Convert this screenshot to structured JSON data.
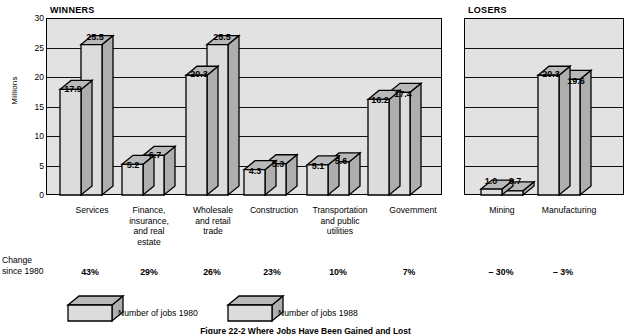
{
  "chart_data": {
    "type": "bar",
    "title": "",
    "ylabel": "Millions",
    "xlabel": "",
    "ylim": [
      0,
      30
    ],
    "yticks": [
      0,
      5,
      10,
      15,
      20,
      25,
      30
    ],
    "grid": true,
    "legend_position": "bottom",
    "panels": [
      {
        "name": "WINNERS",
        "categories": [
          "Services",
          "Finance,\ninsurance,\nand real\nestate",
          "Wholesale\nand retail\ntrade",
          "Construction",
          "Transportation\nand public\nutilities",
          "Government"
        ],
        "series": [
          {
            "name": "Number of jobs 1980",
            "values": [
              17.9,
              5.2,
              20.3,
              4.3,
              5.1,
              16.2
            ]
          },
          {
            "name": "Number of jobs 1988",
            "values": [
              25.5,
              6.7,
              25.5,
              5.3,
              5.6,
              17.4
            ]
          }
        ],
        "change_since_1980": [
          "43%",
          "29%",
          "26%",
          "23%",
          "10%",
          "7%"
        ]
      },
      {
        "name": "LOSERS",
        "categories": [
          "Mining",
          "Manufacturing"
        ],
        "series": [
          {
            "name": "Number of jobs 1980",
            "values": [
              1.0,
              20.3
            ]
          },
          {
            "name": "Number of jobs 1988",
            "values": [
              0.7,
              19.6
            ]
          }
        ],
        "change_since_1980": [
          "– 30%",
          "– 3%"
        ]
      }
    ]
  },
  "panel_titles": {
    "winners": "WINNERS",
    "losers": "LOSERS"
  },
  "axis": {
    "ylabel": "Millions",
    "ticks": [
      "30",
      "25",
      "20",
      "15",
      "10",
      "5",
      "0"
    ]
  },
  "change_row": {
    "line1": "Change",
    "line2": "since 1980"
  },
  "legend": {
    "items": [
      {
        "label": "Number of jobs 1980"
      },
      {
        "label": "Number of jobs 1988"
      }
    ]
  },
  "caption": {
    "text": "Figure 22-2   Where Jobs Have Been Gained and Lost"
  },
  "values": {
    "services_1980": "17.9",
    "services_1988": "25.5",
    "finance_1980": "5.2",
    "finance_1988": "6.7",
    "wholesale_1980": "20.3",
    "wholesale_1988": "25.5",
    "construction_1980": "4.3",
    "construction_1988": "5.3",
    "transportation_1980": "5.1",
    "transportation_1988": "5.6",
    "government_1980": "16.2",
    "government_1988": "17.4",
    "mining_1980": "1.0",
    "mining_1988": "0.7",
    "manufacturing_1980": "20.3",
    "manufacturing_1988": "19.6"
  },
  "categories": {
    "services": "Services",
    "finance": "Finance,\ninsurance,\nand real\nestate",
    "wholesale": "Wholesale\nand retail\ntrade",
    "construction": "Construction",
    "transportation": "Transportation\nand public\nutilities",
    "government": "Government",
    "mining": "Mining",
    "manufacturing": "Manufacturing"
  },
  "changes": {
    "services": "43%",
    "finance": "29%",
    "wholesale": "26%",
    "construction": "23%",
    "transportation": "10%",
    "government": "7%",
    "mining": "– 30%",
    "manufacturing": "– 3%"
  },
  "colors": {
    "front": "#dcdcdc",
    "top": "#b9b9b9",
    "side": "#aeaeae",
    "plot_bg": "#e2e2e2",
    "outline": "#000000"
  }
}
